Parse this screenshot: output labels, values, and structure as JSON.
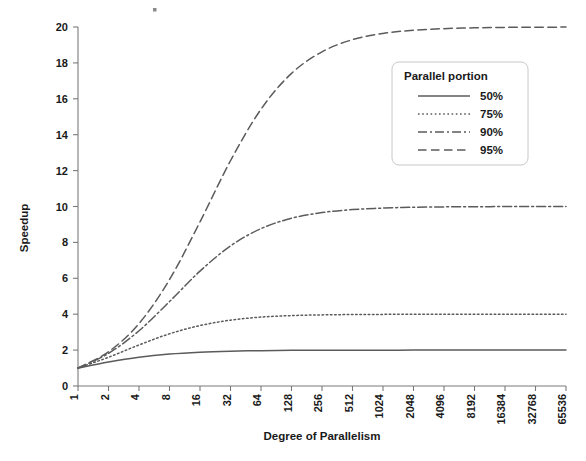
{
  "chart_data": {
    "type": "line",
    "title": "",
    "xlabel": "Degree of Parallelism",
    "ylabel": "Speedup",
    "x_scale": "log2",
    "x": [
      1,
      2,
      4,
      8,
      16,
      32,
      64,
      128,
      256,
      512,
      1024,
      2048,
      4096,
      8192,
      16384,
      32768,
      65536
    ],
    "xtick_labels": [
      "1",
      "2",
      "4",
      "8",
      "16",
      "32",
      "64",
      "128",
      "256",
      "512",
      "1024",
      "2048",
      "4096",
      "8192",
      "16384",
      "32768",
      "65536"
    ],
    "ytick_labels": [
      "0",
      "2",
      "4",
      "6",
      "8",
      "10",
      "12",
      "14",
      "16",
      "18",
      "20"
    ],
    "ylim": [
      0,
      20
    ],
    "ytick_step": 2,
    "grid": false,
    "legend_position": "upper-right",
    "legend_title": "Parallel portion",
    "series": [
      {
        "name": "50%",
        "parallel_fraction": 0.5,
        "dash": "solid",
        "color": "#5b5b5b",
        "values": [
          1.0,
          1.333,
          1.6,
          1.778,
          1.882,
          1.939,
          1.969,
          1.985,
          1.992,
          1.996,
          1.998,
          1.999,
          2.0,
          2.0,
          2.0,
          2.0,
          2.0
        ]
      },
      {
        "name": "75%",
        "parallel_fraction": 0.75,
        "dash": "dotted",
        "color": "#5b5b5b",
        "values": [
          1.0,
          1.6,
          2.286,
          2.909,
          3.368,
          3.669,
          3.84,
          3.923,
          3.962,
          3.981,
          3.99,
          3.995,
          3.998,
          3.999,
          3.999,
          4.0,
          4.0
        ]
      },
      {
        "name": "90%",
        "parallel_fraction": 0.9,
        "dash": "dash-dot",
        "color": "#5b5b5b",
        "values": [
          1.0,
          1.818,
          3.077,
          4.706,
          6.4,
          7.805,
          8.767,
          9.346,
          9.662,
          9.828,
          9.913,
          9.956,
          9.978,
          9.989,
          9.995,
          9.997,
          9.999
        ]
      },
      {
        "name": "95%",
        "parallel_fraction": 0.95,
        "dash": "dashed",
        "color": "#5b5b5b",
        "values": [
          1.0,
          1.905,
          3.478,
          5.926,
          9.143,
          12.549,
          15.422,
          17.415,
          18.618,
          19.294,
          19.641,
          19.819,
          19.909,
          19.955,
          19.977,
          19.989,
          19.994
        ]
      }
    ]
  }
}
